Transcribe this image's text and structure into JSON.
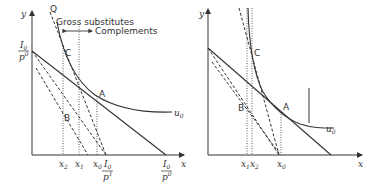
{
  "figure": {
    "left_panel": {
      "axis_y_label": "y",
      "axis_x_label": "x",
      "intercept_y_num": "I",
      "intercept_y_num_sub": "0",
      "intercept_y_den": "p",
      "intercept_y_den_sub": "y",
      "intercept_y_den_sup": "0",
      "point_q": "Q",
      "point_c": "C",
      "point_a": "A",
      "point_b": "B",
      "curve_label": "u",
      "curve_label_sub": "0",
      "annotation_top": "Gross substitutes",
      "annotation_bottom": "Complements",
      "ticks": [
        {
          "main": "x",
          "sub": "2"
        },
        {
          "main": "x",
          "sub": "1"
        },
        {
          "main": "x",
          "sub": "0"
        }
      ],
      "budget_intercept_1_num": "I",
      "budget_intercept_1_num_sub": "0",
      "budget_intercept_1_den": "p",
      "budget_intercept_1_den_sub": "x",
      "budget_intercept_1_den_sup": "1",
      "budget_intercept_0_num": "I",
      "budget_intercept_0_num_sub": "0",
      "budget_intercept_0_den": "p",
      "budget_intercept_0_den_sub": "x",
      "budget_intercept_0_den_sup": "0"
    },
    "right_panel": {
      "axis_y_label": "y",
      "axis_x_label": "x",
      "point_c": "C",
      "point_a": "A",
      "point_b": "B",
      "curve_label": "u",
      "curve_label_sub": "0",
      "ticks": [
        {
          "main": "x",
          "sub": "1"
        },
        {
          "main": "x",
          "sub": "2"
        },
        {
          "main": "x",
          "sub": "0"
        }
      ]
    },
    "colors": {
      "line": "#333333",
      "background": "#ffffff"
    }
  }
}
